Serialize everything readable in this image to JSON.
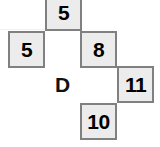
{
  "figure": {
    "title": "",
    "background_color": "#ffffff",
    "cell_fill_color": "#ececec",
    "cell_border_color": "#808080",
    "text_color": "#000000",
    "grid": {
      "columns": 4,
      "rows": 4,
      "cell_size_px": 37
    }
  },
  "cells": [
    {
      "name": "cell-top-five",
      "value": "5",
      "col": 1,
      "row": 0,
      "x": 45,
      "y": -6,
      "w": 37,
      "h": 37,
      "filled": true
    },
    {
      "name": "cell-left-five",
      "value": "5",
      "col": 0,
      "row": 1,
      "x": 8,
      "y": 31,
      "w": 37,
      "h": 37,
      "filled": true
    },
    {
      "name": "cell-eight",
      "value": "8",
      "col": 2,
      "row": 1,
      "x": 80,
      "y": 31,
      "w": 37,
      "h": 37,
      "filled": true
    },
    {
      "name": "cell-label-d",
      "value": "D",
      "col": 1,
      "row": 2,
      "x": 44,
      "y": 66,
      "w": 37,
      "h": 37,
      "filled": false
    },
    {
      "name": "cell-eleven",
      "value": "11",
      "col": 3,
      "row": 2,
      "x": 117,
      "y": 66,
      "w": 37,
      "h": 37,
      "filled": true
    },
    {
      "name": "cell-ten",
      "value": "10",
      "col": 2,
      "row": 3,
      "x": 80,
      "y": 103,
      "w": 37,
      "h": 37,
      "filled": true
    }
  ],
  "faint_lines": {
    "horizontal": [
      {
        "x": 0,
        "y": 29,
        "w": 45
      }
    ],
    "vertical": [
      {
        "x": 45,
        "y": 0,
        "h": 29
      }
    ]
  }
}
